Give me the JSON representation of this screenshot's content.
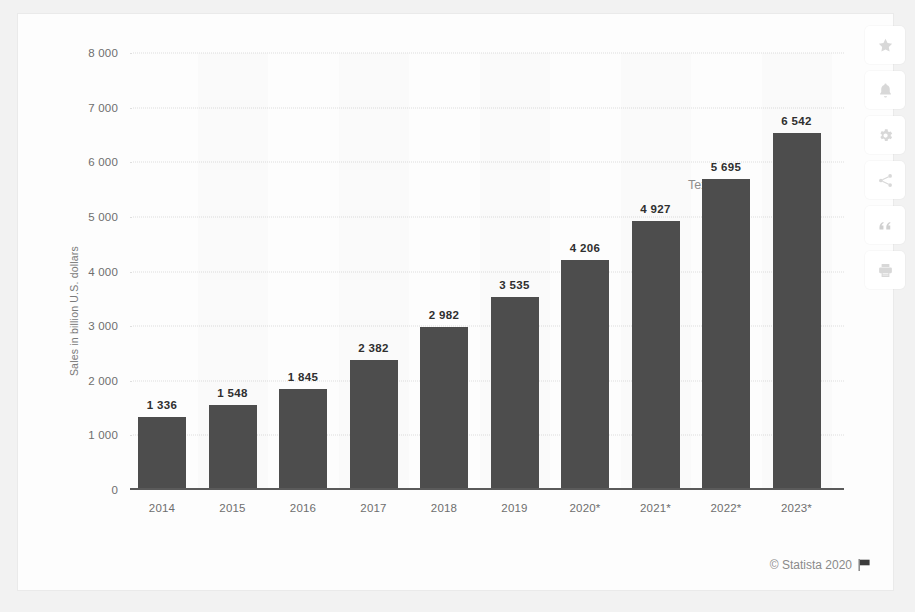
{
  "chart_data": {
    "type": "bar",
    "title": "",
    "xlabel": "",
    "ylabel": "Sales in billion U.S. dollars",
    "ylim": [
      0,
      8000
    ],
    "ytick_labels": [
      "8 000",
      "7 000",
      "6 000",
      "5 000",
      "4 000",
      "3 000",
      "2 000",
      "1 000",
      "0"
    ],
    "ytick_values": [
      8000,
      7000,
      6000,
      5000,
      4000,
      3000,
      2000,
      1000,
      0
    ],
    "categories": [
      "2014",
      "2015",
      "2016",
      "2017",
      "2018",
      "2019",
      "2020*",
      "2021*",
      "2022*",
      "2023*"
    ],
    "values": [
      1336,
      1548,
      1845,
      2382,
      2982,
      3535,
      4206,
      4927,
      5695,
      6542
    ],
    "value_labels": [
      "1 336",
      "1 548",
      "1 845",
      "2 382",
      "2 982",
      "3 535",
      "4 206",
      "4 927",
      "5 695",
      "6 542"
    ],
    "grid": true,
    "legend": "none",
    "bar_color": "#4d4d4d",
    "annotations": [
      {
        "text": "Text",
        "note": "grey stray text label near the 2022* bar"
      }
    ]
  },
  "footer": {
    "copyright": "© Statista 2020",
    "flag_icon": "flag-icon"
  },
  "icon_rail": [
    {
      "name": "favorite-star-icon",
      "label": "Favorite"
    },
    {
      "name": "notification-bell-icon",
      "label": "Notifications"
    },
    {
      "name": "settings-gear-icon",
      "label": "Settings"
    },
    {
      "name": "share-icon",
      "label": "Share"
    },
    {
      "name": "citation-quote-icon",
      "label": "Cite"
    },
    {
      "name": "print-icon",
      "label": "Print"
    }
  ]
}
